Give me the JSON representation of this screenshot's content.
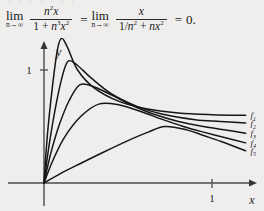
{
  "page": {
    "background_color": "#f0eeec",
    "ink_color": "#161616",
    "cutoff_top_line": "· · ·   ·  ·  ·   ·"
  },
  "equation": {
    "lim1": {
      "operator": "lim",
      "subscript": "n→∞"
    },
    "fraction1": {
      "numerator": "n2x",
      "denominator": "1 + n3x2"
    },
    "relation1": "=",
    "lim2": {
      "operator": "lim",
      "subscript": "n→∞"
    },
    "fraction2": {
      "numerator": "x",
      "denominator": "1/n2 + nx2"
    },
    "relation2": "=",
    "result": "0."
  },
  "figure": {
    "x_axis_label": "x",
    "y_axis_label": "y",
    "x_tick_label": "1",
    "y_tick_label": "1",
    "curve_labels": [
      "f1",
      "f2",
      "f3",
      "f4",
      "f5"
    ],
    "curve_label_indices": [
      "1",
      "2",
      "3",
      "4",
      "5"
    ]
  },
  "chart_data": {
    "type": "line",
    "title": "",
    "xlabel": "x",
    "ylabel": "y",
    "xlim": [
      0,
      1.25
    ],
    "ylim": [
      0,
      1.35
    ],
    "xticks": [
      1
    ],
    "xticklabels": [
      "1"
    ],
    "yticks": [
      1
    ],
    "yticklabels": [
      "1"
    ],
    "grid": false,
    "legend": "right-of-curve-ends",
    "function": "f_n(x) = n^2 x / (1 + n^3 x^2)",
    "series": [
      {
        "name": "f1",
        "n": 1,
        "peak_x": 0.105,
        "peak_y": 1.28,
        "end_x": 1.2,
        "end_y": 0.6,
        "x": [
          0.0,
          0.02,
          0.05,
          0.08,
          0.105,
          0.14,
          0.2,
          0.3,
          0.45,
          0.6,
          0.8,
          1.0,
          1.2
        ],
        "y": [
          0.0,
          0.42,
          0.85,
          1.18,
          1.28,
          1.2,
          1.0,
          0.84,
          0.72,
          0.66,
          0.62,
          0.605,
          0.6
        ]
      },
      {
        "name": "f2",
        "n": 2,
        "peak_x": 0.145,
        "peak_y": 1.08,
        "end_x": 1.2,
        "end_y": 0.53,
        "x": [
          0.0,
          0.03,
          0.07,
          0.11,
          0.145,
          0.2,
          0.28,
          0.4,
          0.55,
          0.7,
          0.9,
          1.05,
          1.2
        ],
        "y": [
          0.0,
          0.33,
          0.68,
          0.95,
          1.08,
          1.04,
          0.93,
          0.79,
          0.68,
          0.61,
          0.56,
          0.545,
          0.53
        ]
      },
      {
        "name": "f3",
        "n": 3,
        "peak_x": 0.215,
        "peak_y": 0.87,
        "end_x": 1.2,
        "end_y": 0.44,
        "x": [
          0.0,
          0.04,
          0.09,
          0.15,
          0.215,
          0.3,
          0.4,
          0.52,
          0.65,
          0.8,
          0.95,
          1.08,
          1.2
        ],
        "y": [
          0.0,
          0.26,
          0.51,
          0.73,
          0.87,
          0.85,
          0.78,
          0.69,
          0.61,
          0.545,
          0.5,
          0.47,
          0.44
        ]
      },
      {
        "name": "f4",
        "n": 4,
        "peak_x": 0.33,
        "peak_y": 0.7,
        "end_x": 1.2,
        "end_y": 0.355,
        "x": [
          0.0,
          0.05,
          0.12,
          0.22,
          0.33,
          0.45,
          0.58,
          0.7,
          0.83,
          0.95,
          1.08,
          1.2
        ],
        "y": [
          0.0,
          0.19,
          0.4,
          0.59,
          0.7,
          0.69,
          0.63,
          0.565,
          0.5,
          0.45,
          0.4,
          0.355
        ]
      },
      {
        "name": "f5",
        "n": 5,
        "peak_x": 0.72,
        "peak_y": 0.5,
        "end_x": 1.2,
        "end_y": 0.285,
        "x": [
          0.0,
          0.1,
          0.22,
          0.35,
          0.5,
          0.62,
          0.72,
          0.85,
          0.95,
          1.05,
          1.13,
          1.2
        ],
        "y": [
          0.0,
          0.085,
          0.175,
          0.27,
          0.375,
          0.45,
          0.5,
          0.47,
          0.42,
          0.37,
          0.325,
          0.285
        ]
      }
    ]
  }
}
